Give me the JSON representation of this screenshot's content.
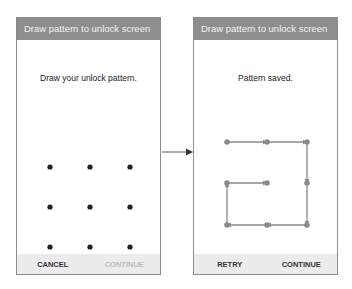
{
  "left_screen": {
    "title": "Draw pattern to unlock screen",
    "prompt": "Draw your unlock pattern.",
    "buttons": {
      "cancel": "CANCEL",
      "continue": "CONTINUE"
    },
    "continue_enabled": false
  },
  "right_screen": {
    "title": "Draw pattern to unlock screen",
    "prompt": "Pattern saved.",
    "buttons": {
      "retry": "RETRY",
      "continue": "CONTINUE"
    },
    "continue_enabled": true,
    "pattern_sequence": [
      4,
      5,
      1,
      2,
      3,
      6,
      9,
      8,
      7
    ]
  },
  "colors": {
    "header_bg": "#8e8e8e",
    "footer_bg": "#ececec",
    "dot": "#222222",
    "pattern": "#8a8a8a"
  },
  "icons": {
    "transition": "right-arrow-icon"
  }
}
